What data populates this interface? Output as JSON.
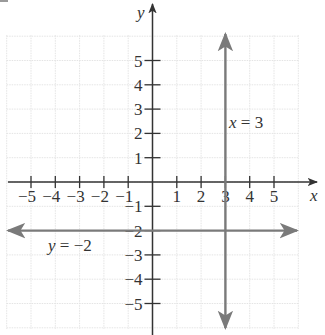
{
  "chart_data": {
    "type": "line",
    "title": "",
    "xlabel": "x",
    "ylabel": "y",
    "xlim": [
      -6,
      6
    ],
    "ylim": [
      -6,
      6
    ],
    "grid": true,
    "x_ticks": [
      -5,
      -4,
      -3,
      -2,
      -1,
      1,
      2,
      3,
      4,
      5
    ],
    "y_ticks": [
      -5,
      -4,
      -3,
      -2,
      -1,
      1,
      2,
      3,
      4,
      5
    ],
    "x_tick_labels": [
      "−5",
      "−4",
      "−3",
      "−2",
      "−1",
      "1",
      "2",
      "3",
      "4",
      "5"
    ],
    "y_tick_labels": [
      "−5",
      "−4",
      "−3",
      "−2",
      "−1",
      "1",
      "2",
      "3",
      "4",
      "5"
    ],
    "series": [
      {
        "name": "x = 3",
        "kind": "vertical",
        "x": [
          3,
          3
        ],
        "y": [
          -6,
          6
        ],
        "color": "#7a7a7a",
        "arrows": "both"
      },
      {
        "name": "y = −2",
        "kind": "horizontal",
        "x": [
          -6,
          6
        ],
        "y": [
          -2,
          -2
        ],
        "color": "#7a7a7a",
        "arrows": "both"
      }
    ],
    "annotations": [
      {
        "text": "x = 3",
        "at": [
          3.1,
          2.3
        ]
      },
      {
        "text": "y = −2",
        "at": [
          -4.4,
          -2.7
        ]
      }
    ]
  },
  "labels": {
    "x_axis": "x",
    "y_axis": "y",
    "line_v": {
      "var": "x",
      "eq": " = 3"
    },
    "line_h": {
      "var": "y",
      "eq": " = −2"
    }
  },
  "colors": {
    "axis": "#333333",
    "lines": "#7a7a7a",
    "grid": "#e4e4e4"
  }
}
